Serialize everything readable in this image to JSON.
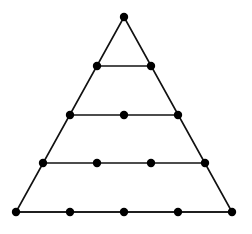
{
  "diagram": {
    "type": "triangular-dot-grid",
    "rows": 5,
    "line_color": "#111111",
    "dot_color": "#000000",
    "line_width": 1.6,
    "dot_radius": 4.2,
    "outline": [
      [
        124,
        17
      ],
      [
        16,
        212
      ],
      [
        232,
        212
      ]
    ],
    "horizontal_lines": [
      [
        [
          97,
          66
        ],
        [
          151,
          66
        ]
      ],
      [
        [
          70,
          115
        ],
        [
          178,
          115
        ]
      ],
      [
        [
          43,
          163
        ],
        [
          205,
          163
        ]
      ],
      [
        [
          16,
          212
        ],
        [
          232,
          212
        ]
      ]
    ],
    "points": [
      [
        [
          124,
          17
        ]
      ],
      [
        [
          97,
          66
        ],
        [
          151,
          66
        ]
      ],
      [
        [
          70,
          115
        ],
        [
          124,
          115
        ],
        [
          178,
          115
        ]
      ],
      [
        [
          43,
          163
        ],
        [
          97,
          163
        ],
        [
          151,
          163
        ],
        [
          205,
          163
        ]
      ],
      [
        [
          16,
          212
        ],
        [
          70,
          212
        ],
        [
          124,
          212
        ],
        [
          178,
          212
        ],
        [
          232,
          212
        ]
      ]
    ]
  }
}
